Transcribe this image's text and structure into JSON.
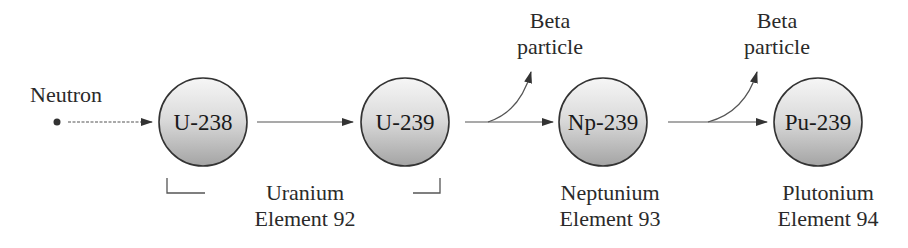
{
  "diagram": {
    "title": "",
    "neutron_label": "Neutron",
    "nodes": [
      {
        "id": "u238",
        "label": "U-238"
      },
      {
        "id": "u239",
        "label": "U-239"
      },
      {
        "id": "np239",
        "label": "Np-239"
      },
      {
        "id": "pu239",
        "label": "Pu-239"
      }
    ],
    "beta_labels": [
      {
        "line1": "Beta",
        "line2": "particle"
      },
      {
        "line1": "Beta",
        "line2": "particle"
      }
    ],
    "element_labels": [
      {
        "name": "Uranium",
        "element": "Element 92"
      },
      {
        "name": "Neptunium",
        "element": "Element 93"
      },
      {
        "name": "Plutonium",
        "element": "Element 94"
      }
    ],
    "colors": {
      "circle_fill_top": "#f4f4f4",
      "circle_fill_bottom": "#a8a8a8",
      "stroke": "#333333"
    }
  }
}
